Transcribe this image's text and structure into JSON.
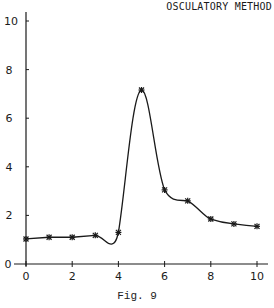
{
  "chart_data": {
    "type": "line",
    "title": "OSCULATORY METHOD",
    "caption": "Fig. 9",
    "xlabel": "",
    "ylabel": "",
    "xlim": [
      0,
      10
    ],
    "ylim": [
      0,
      10
    ],
    "x_ticks": [
      0,
      2,
      4,
      6,
      8,
      10
    ],
    "y_ticks": [
      0,
      2,
      4,
      6,
      8,
      10
    ],
    "grid": false,
    "marker": "asterisk",
    "series": [
      {
        "name": "data points",
        "x": [
          0,
          1,
          2,
          3,
          4,
          5,
          6,
          7,
          8,
          9,
          10
        ],
        "y": [
          1.03,
          1.1,
          1.1,
          1.18,
          1.3,
          7.16,
          3.05,
          2.6,
          1.85,
          1.65,
          1.55
        ]
      }
    ],
    "curve_note": "smooth osculatory interpolation; dips to ~0.82 near x=3.7"
  },
  "colors": {
    "line": "#1a1a1a",
    "background": "#ffffff"
  }
}
